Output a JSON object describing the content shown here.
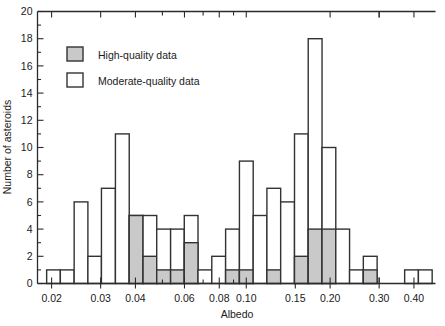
{
  "chart_data": {
    "type": "bar",
    "title": "",
    "xlabel": "Albedo",
    "ylabel": "Number of asteroids",
    "xscale": "log",
    "xlim": [
      0.0178,
      0.478
    ],
    "ylim": [
      0,
      20
    ],
    "grid": false,
    "legend_position": "upper-left",
    "ytick_labels": [
      "0",
      "2",
      "4",
      "6",
      "8",
      "10",
      "12",
      "14",
      "16",
      "18",
      "20"
    ],
    "ytick_values": [
      0,
      2,
      4,
      6,
      8,
      10,
      12,
      14,
      16,
      18,
      20
    ],
    "xtick_labels": [
      "0.02",
      "0.03",
      "0.04",
      "0.06",
      "0.08",
      "0.10",
      "0.15",
      "0.20",
      "0.30",
      "0.40"
    ],
    "xtick_values": [
      0.02,
      0.03,
      0.04,
      0.06,
      0.08,
      0.1,
      0.15,
      0.2,
      0.3,
      0.4
    ],
    "xminor_values": [
      0.05,
      0.07,
      0.09,
      0.25,
      0.35,
      0.45
    ],
    "series": [
      {
        "name": "Moderate-quality data",
        "fill": "#ffffff",
        "edge": "#333333"
      },
      {
        "name": "High-quality data",
        "fill": "#c9c9c9",
        "edge": "#333333"
      }
    ],
    "bin_edges": [
      0.0192,
      0.0215,
      0.0241,
      0.027,
      0.0302,
      0.0339,
      0.038,
      0.0426,
      0.0477,
      0.0535,
      0.0599,
      0.0671,
      0.0752,
      0.0843,
      0.0945,
      0.1059,
      0.1186,
      0.1329,
      0.149,
      0.1669,
      0.1871,
      0.2096,
      0.2349,
      0.2632,
      0.295,
      0.3305,
      0.3704,
      0.415,
      0.465
    ],
    "bins": [
      {
        "x0": 0.0192,
        "x1": 0.0215,
        "total": 1,
        "high": 0
      },
      {
        "x0": 0.0215,
        "x1": 0.0241,
        "total": 1,
        "high": 0
      },
      {
        "x0": 0.0241,
        "x1": 0.027,
        "total": 6,
        "high": 0
      },
      {
        "x0": 0.027,
        "x1": 0.0302,
        "total": 2,
        "high": 0
      },
      {
        "x0": 0.0302,
        "x1": 0.0339,
        "total": 7,
        "high": 0
      },
      {
        "x0": 0.0339,
        "x1": 0.038,
        "total": 11,
        "high": 0
      },
      {
        "x0": 0.038,
        "x1": 0.0426,
        "total": 5,
        "high": 5
      },
      {
        "x0": 0.0426,
        "x1": 0.0477,
        "total": 5,
        "high": 2
      },
      {
        "x0": 0.0477,
        "x1": 0.0535,
        "total": 4,
        "high": 1
      },
      {
        "x0": 0.0535,
        "x1": 0.0599,
        "total": 4,
        "high": 1
      },
      {
        "x0": 0.0599,
        "x1": 0.0671,
        "total": 5,
        "high": 3
      },
      {
        "x0": 0.0671,
        "x1": 0.0752,
        "total": 1,
        "high": 0
      },
      {
        "x0": 0.0752,
        "x1": 0.0843,
        "total": 2,
        "high": 0
      },
      {
        "x0": 0.0843,
        "x1": 0.0945,
        "total": 4,
        "high": 1
      },
      {
        "x0": 0.0945,
        "x1": 0.1059,
        "total": 9,
        "high": 1
      },
      {
        "x0": 0.1059,
        "x1": 0.1186,
        "total": 5,
        "high": 0
      },
      {
        "x0": 0.1186,
        "x1": 0.1329,
        "total": 7,
        "high": 1
      },
      {
        "x0": 0.1329,
        "x1": 0.149,
        "total": 6,
        "high": 0
      },
      {
        "x0": 0.149,
        "x1": 0.1669,
        "total": 11,
        "high": 2
      },
      {
        "x0": 0.1669,
        "x1": 0.1871,
        "total": 18,
        "high": 4
      },
      {
        "x0": 0.1871,
        "x1": 0.2096,
        "total": 10,
        "high": 4
      },
      {
        "x0": 0.2096,
        "x1": 0.2349,
        "total": 4,
        "high": 0
      },
      {
        "x0": 0.2349,
        "x1": 0.2632,
        "total": 1,
        "high": 0
      },
      {
        "x0": 0.2632,
        "x1": 0.295,
        "total": 2,
        "high": 1
      },
      {
        "x0": 0.295,
        "x1": 0.3305,
        "total": 0,
        "high": 0
      },
      {
        "x0": 0.3305,
        "x1": 0.3704,
        "total": 0,
        "high": 0
      },
      {
        "x0": 0.3704,
        "x1": 0.415,
        "total": 1,
        "high": 0
      },
      {
        "x0": 0.415,
        "x1": 0.465,
        "total": 1,
        "high": 0
      }
    ]
  },
  "legend": {
    "items": [
      {
        "label": "High-quality data",
        "swatch": "#c9c9c9"
      },
      {
        "label": "Moderate-quality data",
        "swatch": "#ffffff"
      }
    ]
  },
  "axes": {
    "x_title": "Albedo",
    "y_title": "Number of asteroids"
  }
}
